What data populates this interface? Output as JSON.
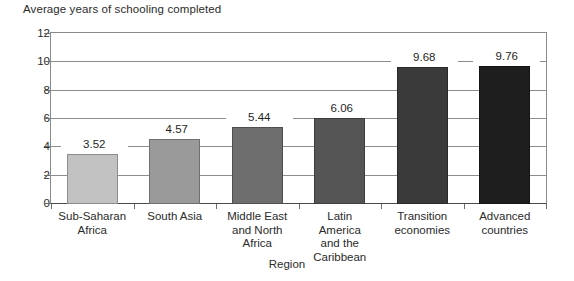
{
  "chart_data": {
    "type": "bar",
    "title": "Average years of schooling completed",
    "xlabel": "Region",
    "ylabel": "Average years of schooling completed",
    "ylim": [
      0,
      12
    ],
    "yticks": [
      0,
      2,
      4,
      6,
      8,
      10,
      12
    ],
    "ytick_labels": [
      "0",
      "2",
      "4",
      "6",
      "8",
      "10",
      "12"
    ],
    "grid": true,
    "legend": "none",
    "categories": [
      "Sub-Saharan Africa",
      "South Asia",
      "Middle East and North Africa",
      "Latin America and the Caribbean",
      "Transition economies",
      "Advanced countries"
    ],
    "category_label_lines": [
      [
        "Sub-Saharan",
        "Africa"
      ],
      [
        "South Asia"
      ],
      [
        "Middle East",
        "and North",
        "Africa"
      ],
      [
        "Latin",
        "America",
        "and the",
        "Caribbean"
      ],
      [
        "Transition",
        "economies"
      ],
      [
        "Advanced",
        "countries"
      ]
    ],
    "values": [
      3.52,
      4.57,
      5.44,
      6.06,
      9.68,
      9.76
    ],
    "value_labels": [
      "3.52",
      "4.57",
      "5.44",
      "6.06",
      "9.68",
      "9.76"
    ],
    "bar_colors": [
      "#c2c2c2",
      "#9a9a9a",
      "#6e6e6e",
      "#555555",
      "#3a3a3a",
      "#1e1e1e"
    ],
    "axis_color": "#8a8a8a",
    "grid_color": "#8d8d8d",
    "text_color": "#2b2b2b",
    "background": "#ffffff"
  }
}
